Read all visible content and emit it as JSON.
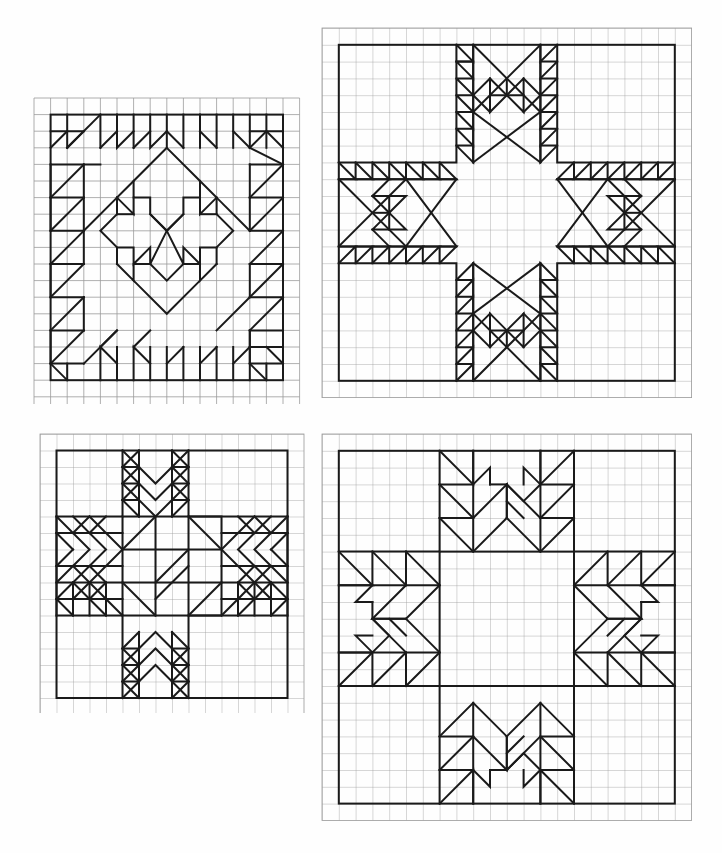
{
  "page": {
    "background_color": "#fefefe",
    "grid_line_color": "#9a9a9a",
    "pattern_line_color": "#1a1a1a",
    "grid_line_width": 0.8,
    "pattern_line_width": 2.0,
    "width": 722,
    "height": 853
  },
  "blocks": [
    {
      "id": "block-top-left",
      "name": "Feathered Star Variation",
      "position": {
        "x": 34,
        "y": 98
      },
      "cell": 16.6,
      "cols": 16,
      "rows": 18,
      "border": {
        "x0": 1,
        "y0": 1,
        "x1": 15,
        "y1": 17
      },
      "paths": [
        "M1,1 L15,1 L15,17 L1,17 Z",
        "M1,1 L3,1 L3,3 L1,3 Z",
        "M1,3 L3,1",
        "M3,3 L5,1 L5,3 L3,5 L5,5 L5,3",
        "M3,3 L3,5 L1,5 L1,7 L3,7 L3,5",
        "M1,7 L3,5",
        "M1,7 L3,9 L3,7",
        "M3,9 L1,9 L1,11",
        "M5,1 L7,3 L7,1",
        "M7,1 L9,3",
        "M5,5 L7,3 L7,5",
        "M7,5 L5,7 L7,7",
        "M5,7 L3,9 L5,9 L5,7",
        "M9,1 L11,3 L11,1",
        "M11,1 L13,3",
        "M13,1 L13,3 L11,5 L11,3",
        "M13,3 L15,5 L15,3",
        "M13,5 L13,7 L15,7 L15,5",
        "M15,7 L13,9 L13,7",
        "M13,9 L15,9 L15,11",
        "M11,5 L11,7 L13,7",
        "M11,7 L13,9",
        "M9,1 L9,3 L7,3",
        "M15,1 L13,1 L13,3",
        "M1,11 L3,9",
        "M1,11 L1,13 L3,13 L3,11 L1,11",
        "M1,13 L3,11",
        "M3,13 L5,11 L5,13 L3,15 L5,15 L5,13",
        "M1,15 L3,13",
        "M1,15 L1,17 L3,17 L3,15 L1,15",
        "M3,15 L1,17",
        "M5,15 L7,13 L7,15",
        "M5,17 L7,15 L7,17",
        "M7,17 L9,15 L9,17",
        "M9,17 L11,15 L11,17",
        "M11,17 L13,15 L13,17",
        "M13,17 L15,15 L15,17",
        "M15,11 L13,13 L15,13",
        "M13,13 L11,13 L11,11",
        "M15,13 L13,15 L15,15",
        "M13,15 L13,13",
        "M15,15 L13,17",
        "M8,3 L12,7 L12,5 L10,5 L10,7 L8,9 L6,7 L6,5 L4,5 L4,7 L8,3",
        "M8,3 L4,7 L4,9 L6,9 L6,11 L8,13 L10,11 L10,9 L12,9 L12,7",
        "M4,9 L2,11 L4,13 L4,11 L6,11",
        "M12,9 L14,11 L12,13 L12,11 L10,11",
        "M4,13 L6,13 L6,15 L8,13",
        "M12,13 L10,13 L10,15 L8,13",
        "M8,13 L6,15 L4,15 L4,13",
        "M8,13 L10,15 L12,15 L12,13",
        "M6,15 L8,17 L10,15",
        "M8,3 L8,3"
      ]
    },
    {
      "id": "block-top-right",
      "name": "Sawtooth Star with Feathered Arms",
      "position": {
        "x": 322,
        "y": 27
      },
      "cell": 16.8,
      "cols": 22,
      "rows": 22,
      "border": {
        "x0": 1,
        "y0": 1,
        "x1": 21,
        "y1": 21
      },
      "paths": [
        "M1,1 L21,1 L21,21 L1,21 Z",
        "M8,1 L8,8 L1,8 M14,1 L14,8 L21,8 M1,14 L8,14 L8,21 M14,21 L14,14 L21,14",
        "M8,8 L14,8 L14,14 L8,14 Z"
      ]
    },
    {
      "id": "block-bottom-left",
      "name": "Eight Point Feathered Star",
      "position": {
        "x": 40,
        "y": 434
      },
      "cell": 16.5,
      "cols": 16,
      "rows": 17,
      "border": {
        "x0": 1,
        "y0": 1,
        "x1": 15,
        "y1": 16
      },
      "paths": [
        "M1,1 L15,1 L15,16 L1,16 Z"
      ]
    },
    {
      "id": "block-bottom-right",
      "name": "Carpenter Wheel Variation",
      "position": {
        "x": 322,
        "y": 434
      },
      "cell": 16.8,
      "cols": 22,
      "rows": 23,
      "border": {
        "x0": 1,
        "y0": 1,
        "x1": 21,
        "y1": 22
      },
      "paths": [
        "M1,1 L21,1 L21,22 L1,22 Z"
      ]
    }
  ],
  "icons": {
    "grid": "grid-icon",
    "quilt_block": "quilt-block-icon"
  }
}
